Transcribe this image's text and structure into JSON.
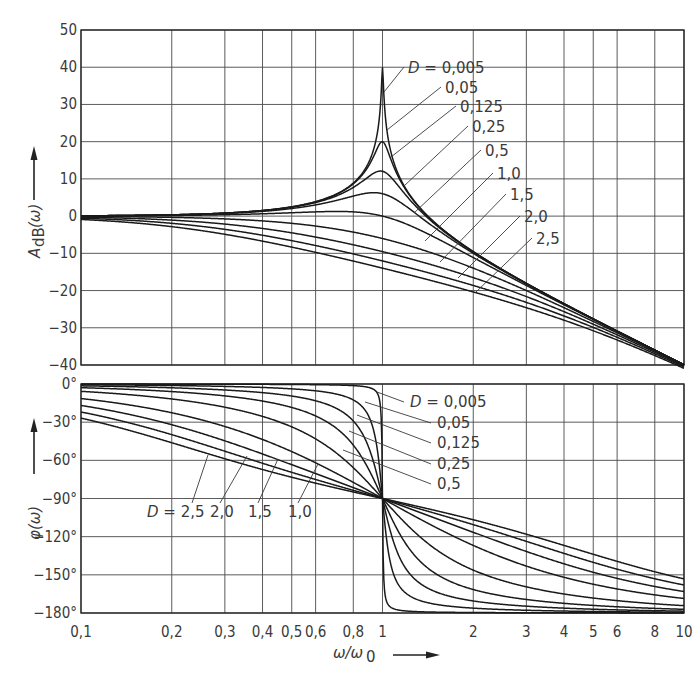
{
  "chart_data": [
    {
      "type": "line",
      "title": "Amplitude response (Bode magnitude) of 2nd-order low-pass",
      "xlabel": "ω/ω0",
      "ylabel": "A_dB(ω)",
      "xscale": "log",
      "xlim": [
        0.1,
        10
      ],
      "ylim": [
        -40,
        50
      ],
      "grid": true,
      "x_ticks": [
        "0,1",
        "0,2",
        "0,3",
        "0,4",
        "0,5",
        "0,6",
        "0,8",
        "1",
        "2",
        "3",
        "4",
        "5",
        "6",
        "8",
        "10"
      ],
      "y_ticks": [
        "50",
        "40",
        "30",
        "20",
        "10",
        "0",
        "-10",
        "-20",
        "-30",
        "-40"
      ],
      "x": [
        0.1,
        0.2,
        0.3,
        0.4,
        0.5,
        0.6,
        0.8,
        1,
        2,
        3,
        4,
        5,
        6,
        8,
        10
      ],
      "series": [
        {
          "name": "D = 0,005",
          "D": 0.005,
          "values": [
            0.09,
            0.35,
            0.82,
            1.51,
            2.5,
            3.88,
            8.87,
            40.0,
            -9.54,
            -18.06,
            -23.52,
            -27.6,
            -30.88,
            -35.97,
            -39.91
          ]
        },
        {
          "name": "0,05",
          "D": 0.05,
          "values": [
            0.09,
            0.35,
            0.81,
            1.48,
            2.45,
            3.78,
            8.4,
            20.0,
            -9.55,
            -18.07,
            -23.53,
            -27.6,
            -30.88,
            -35.97,
            -39.92
          ]
        },
        {
          "name": "0,125",
          "D": 0.125,
          "values": [
            0.07,
            0.31,
            0.73,
            1.33,
            2.17,
            3.29,
            6.48,
            12.04,
            -9.62,
            -18.11,
            -23.55,
            -27.62,
            -30.89,
            -35.98,
            -39.92
          ]
        },
        {
          "name": "0,25",
          "D": 0.25,
          "values": [
            0.06,
            0.23,
            0.54,
            0.97,
            1.54,
            2.23,
            3.66,
            6.02,
            -9.82,
            -18.23,
            -23.63,
            -27.67,
            -30.93,
            -36.0,
            -39.93
          ]
        },
        {
          "name": "0,5",
          "D": 0.5,
          "values": [
            0.0,
            0.01,
            0.0,
            -0.04,
            -0.13,
            -0.29,
            -0.79,
            0.0,
            -10.45,
            -18.64,
            -23.92,
            -27.88,
            -31.09,
            -36.1,
            -40.0
          ]
        },
        {
          "name": "1,0",
          "D": 1.0,
          "values": [
            -0.09,
            -0.34,
            -0.75,
            -1.29,
            -1.94,
            -2.69,
            -4.3,
            -6.02,
            -13.98,
            -20.0,
            -24.61,
            -28.3,
            -31.37,
            -36.26,
            -40.09
          ]
        },
        {
          "name": "1,5",
          "D": 1.5,
          "values": [
            -0.17,
            -0.67,
            -1.42,
            -2.35,
            -3.4,
            -4.5,
            -6.63,
            -9.54,
            -16.24,
            -21.58,
            -25.73,
            -29.12,
            -31.99,
            -36.65,
            -40.35
          ]
        },
        {
          "name": "2,0",
          "D": 2.0,
          "values": [
            -0.28,
            -1.07,
            -2.21,
            -3.54,
            -4.95,
            -6.37,
            -9.0,
            -12.04,
            -18.14,
            -23.14,
            -27.07,
            -30.3,
            -33.03,
            -37.48,
            -41.0
          ]
        },
        {
          "name": "2,5",
          "D": 2.5,
          "values": [
            -0.41,
            -1.52,
            -3.04,
            -4.73,
            -6.42,
            -8.05,
            -11.0,
            -13.98,
            -19.76,
            -24.52,
            -28.28,
            -31.39,
            -34.03,
            -38.34,
            -41.71
          ]
        }
      ],
      "annotations": [
        "D = 0,005",
        "0,05",
        "0,125",
        "0,25",
        "0,5",
        "1,0",
        "1,5",
        "2,0",
        "2,5"
      ]
    },
    {
      "type": "line",
      "title": "Phase response (Bode phase) of 2nd-order low-pass",
      "xlabel": "ω/ω0",
      "ylabel": "φ(ω)",
      "xscale": "log",
      "xlim": [
        0.1,
        10
      ],
      "ylim": [
        -180,
        0
      ],
      "grid": true,
      "x_ticks": [
        "0,1",
        "0,2",
        "0,3",
        "0,4",
        "0,5",
        "0,6",
        "0,8",
        "1",
        "2",
        "3",
        "4",
        "5",
        "6",
        "8",
        "10"
      ],
      "y_ticks": [
        "0°",
        "-30°",
        "-60°",
        "-90°",
        "-120°",
        "-150°",
        "-180°"
      ],
      "x": [
        0.1,
        0.2,
        0.3,
        0.4,
        0.5,
        0.6,
        0.8,
        1,
        2,
        3,
        4,
        5,
        6,
        8,
        10
      ],
      "series": [
        {
          "name": "D = 0,005",
          "D": 0.005,
          "values": [
            -0.06,
            -0.12,
            -0.19,
            -0.27,
            -0.38,
            -0.54,
            -1.27,
            -90,
            -179.62,
            -179.79,
            -179.85,
            -179.88,
            -179.9,
            -179.93,
            -179.94
          ]
        },
        {
          "name": "0,05",
          "D": 0.05,
          "values": [
            -0.58,
            -1.19,
            -1.89,
            -2.73,
            -3.81,
            -5.36,
            -12.53,
            -90,
            -176.19,
            -177.85,
            -178.47,
            -178.81,
            -179.02,
            -179.27,
            -179.42
          ]
        },
        {
          "name": "0,125",
          "D": 0.125,
          "values": [
            -1.45,
            -2.98,
            -4.71,
            -6.79,
            -9.46,
            -13.17,
            -29.05,
            -90,
            -170.54,
            -174.66,
            -176.18,
            -177.02,
            -177.55,
            -178.18,
            -178.55
          ]
        },
        {
          "name": "0,25",
          "D": 0.25,
          "values": [
            -2.89,
            -5.95,
            -9.36,
            -13.39,
            -18.43,
            -25.11,
            -48.01,
            -90,
            -161.57,
            -169.38,
            -172.37,
            -174.05,
            -175.14,
            -176.42,
            -177.11
          ]
        },
        {
          "name": "0,5",
          "D": 0.5,
          "values": [
            -5.77,
            -11.77,
            -18.26,
            -25.46,
            -33.69,
            -43.15,
            -65.77,
            -90,
            -146.31,
            -159.44,
            -165.07,
            -168.23,
            -170.27,
            -172.87,
            -174.23
          ]
        },
        {
          "name": "1,0",
          "D": 1.0,
          "values": [
            -11.42,
            -22.62,
            -33.4,
            -43.6,
            -53.13,
            -61.93,
            -77.32,
            -90,
            -126.87,
            -143.13,
            -151.93,
            -157.38,
            -161.08,
            -165.75,
            -168.58
          ]
        },
        {
          "name": "1,5",
          "D": 1.5,
          "values": [
            -16.86,
            -32.01,
            -44.7,
            -55.01,
            -63.43,
            -70.35,
            -81.38,
            -90,
            -116.57,
            -131.99,
            -141.34,
            -147.7,
            -152.32,
            -158.55,
            -162.61
          ]
        },
        {
          "name": "2,0",
          "D": 2.0,
          "values": [
            -22.05,
            -39.81,
            -52.79,
            -62.02,
            -69.44,
            -74.74,
            -83.16,
            -90,
            -110.56,
            -124.22,
            -133.75,
            -140.71,
            -145.95,
            -153.43,
            -158.27
          ]
        },
        {
          "name": "2,5",
          "D": 2.5,
          "values": [
            -26.81,
            -46.17,
            -58.89,
            -67.17,
            -73.3,
            -77.47,
            -84.11,
            -90,
            -106.7,
            -118.52,
            -127.47,
            -134.25,
            -139.53,
            -147.25,
            -152.46
          ]
        }
      ],
      "annotations": [
        "D = 0,005",
        "0,05",
        "0,125",
        "0,25",
        "0,5",
        "D = 2,5",
        "2,0",
        "1,5",
        "1,0"
      ]
    }
  ],
  "labels": {
    "mag_ylabel_main": "A",
    "mag_ylabel_sub": "dB",
    "mag_ylabel_arg": "(ω)",
    "phase_ylabel": "φ(ω)",
    "xlabel_main": "ω/ω",
    "xlabel_sub": "0"
  },
  "mag_labels": [
    {
      "text": "D = 0,005",
      "x": 408,
      "y": 73
    },
    {
      "text": "0,05",
      "x": 445,
      "y": 93
    },
    {
      "text": "0,125",
      "x": 460,
      "y": 112
    },
    {
      "text": "0,25",
      "x": 472,
      "y": 132
    },
    {
      "text": "0,5",
      "x": 485,
      "y": 156
    },
    {
      "text": "1,0",
      "x": 497,
      "y": 179
    },
    {
      "text": "1,5",
      "x": 510,
      "y": 200
    },
    {
      "text": "2,0",
      "x": 524,
      "y": 222
    },
    {
      "text": "2,5",
      "x": 536,
      "y": 244
    }
  ],
  "phase_labels_right": [
    {
      "text": "D = 0,005",
      "x": 410,
      "y": 407
    },
    {
      "text": "0,05",
      "x": 437,
      "y": 428
    },
    {
      "text": "0,125",
      "x": 437,
      "y": 448
    },
    {
      "text": "0,25",
      "x": 437,
      "y": 469
    },
    {
      "text": "0,5",
      "x": 437,
      "y": 489
    }
  ],
  "phase_labels_left": [
    {
      "text": "D = 2,5",
      "x": 147,
      "y": 517
    },
    {
      "text": "2,0",
      "x": 210,
      "y": 517
    },
    {
      "text": "1,5",
      "x": 248,
      "y": 517
    },
    {
      "text": "1,0",
      "x": 288,
      "y": 517
    }
  ]
}
